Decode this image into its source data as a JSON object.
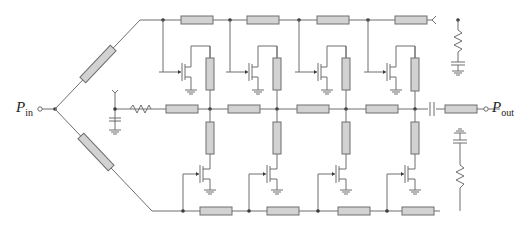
{
  "diagram": {
    "type": "distributed amplifier schematic",
    "labels": {
      "input": {
        "main": "P",
        "sub": "in"
      },
      "output": {
        "main": "P",
        "sub": "out"
      }
    },
    "colors": {
      "wire": "#6e6e6e",
      "transmission_line_fill": "#d2d2d2",
      "node": "#3a3a3a"
    },
    "top_gate_line": {
      "y": 20,
      "nodes_x": [
        163,
        230,
        299,
        368,
        440
      ],
      "tl_x": [
        181,
        247,
        317,
        395
      ]
    },
    "middle_drain_line": {
      "y": 109,
      "nodes_x": [
        141,
        210,
        277,
        346,
        415
      ],
      "tl_x": [
        166,
        233,
        301,
        371,
        447
      ]
    },
    "bottom_gate_line": {
      "y": 211,
      "nodes_x": [
        183,
        249,
        318,
        387
      ],
      "tl_x": [
        200,
        267,
        338,
        402
      ]
    },
    "top_transistors": 4,
    "bottom_transistors": 4
  }
}
